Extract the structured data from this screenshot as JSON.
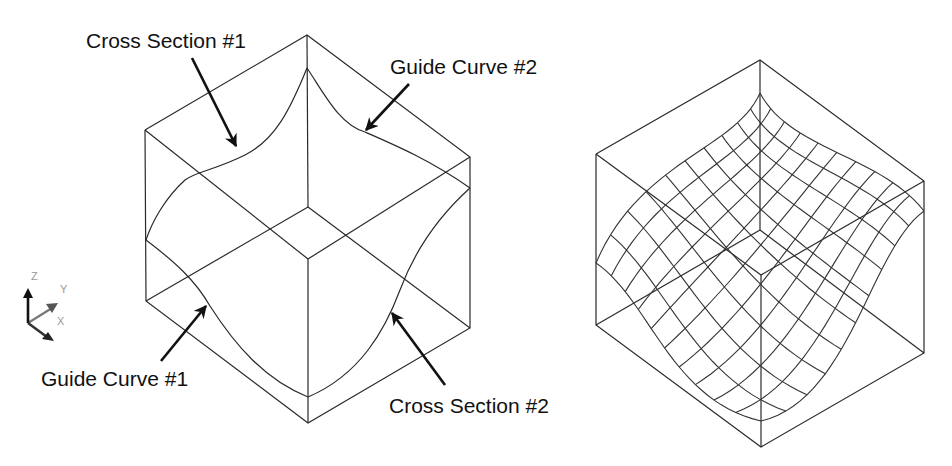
{
  "figure": {
    "left_panel": {
      "name": "boundary-curves-cube",
      "labels": {
        "cross_section_1": "Cross Section #1",
        "guide_curve_2": "Guide Curve #2",
        "guide_curve_1": "Guide Curve #1",
        "cross_section_2": "Cross Section #2"
      }
    },
    "right_panel": {
      "name": "swept-surface-mesh-cube"
    },
    "axis_triad": {
      "z": "Z",
      "y": "Y",
      "x": "X"
    },
    "colors": {
      "line": "#2a2a2a",
      "arrow": "#111111",
      "axis_z": "#111111",
      "axis_y": "#777777",
      "axis_x": "#333333",
      "axis_text": "#9a9a9a"
    }
  }
}
